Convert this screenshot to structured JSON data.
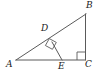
{
  "figure": {
    "background_color": "#ffffff",
    "stroke_color": "#5a5a5a",
    "label_color": "#222222",
    "width": 102,
    "height": 78,
    "vertices": [
      {
        "name": "A",
        "label": "A",
        "x": 16,
        "y": 60
      },
      {
        "name": "B",
        "label": "B",
        "x": 86,
        "y": 14
      },
      {
        "name": "C",
        "label": "C",
        "x": 85,
        "y": 60
      },
      {
        "name": "D",
        "label": "D",
        "x": 52,
        "y": 42
      },
      {
        "name": "E",
        "label": "E",
        "x": 62,
        "y": 60
      }
    ],
    "segments": [
      {
        "name": "AB",
        "from": "A",
        "to": "B"
      },
      {
        "name": "AC",
        "from": "A",
        "to": "C"
      },
      {
        "name": "BC",
        "from": "B",
        "to": "C"
      },
      {
        "name": "DE",
        "from": "D",
        "to": "E"
      }
    ],
    "right_angles": [
      {
        "name": "angle-at-C",
        "vertex": "C",
        "between": [
          "CA",
          "CB"
        ]
      },
      {
        "name": "angle-at-D",
        "vertex": "D",
        "between": [
          "DA",
          "DE"
        ]
      }
    ]
  }
}
